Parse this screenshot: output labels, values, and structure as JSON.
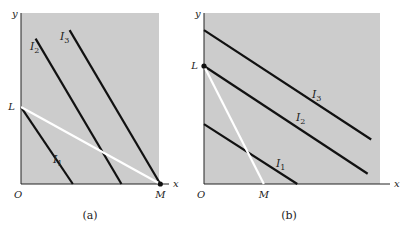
{
  "chart_data": [
    {
      "type": "line",
      "panel": "a",
      "caption": "(a)",
      "xlabel": "x",
      "ylabel": "y",
      "origin_label": "O",
      "xlim": [
        0,
        1
      ],
      "ylim": [
        0,
        1
      ],
      "points": [
        {
          "name": "L",
          "x": 0,
          "y": 0.45,
          "dot": false
        },
        {
          "name": "M",
          "x": 0.86,
          "y": 0,
          "dot": true
        }
      ],
      "budget_line": {
        "name": "LM",
        "color": "#ffffff",
        "from": [
          0,
          0.45
        ],
        "to": [
          0.86,
          0
        ]
      },
      "series": [
        {
          "name": "I1",
          "label_main": "I",
          "label_sub": "1",
          "color": "#111111",
          "from": [
            0,
            0.45
          ],
          "to": [
            0.32,
            0
          ]
        },
        {
          "name": "I2",
          "label_main": "I",
          "label_sub": "2",
          "color": "#111111",
          "from": [
            0.09,
            0.85
          ],
          "to": [
            0.62,
            0
          ]
        },
        {
          "name": "I3",
          "label_main": "I",
          "label_sub": "3",
          "color": "#111111",
          "from": [
            0.3,
            0.9
          ],
          "to": [
            0.86,
            0
          ]
        }
      ],
      "background": "#cccccc"
    },
    {
      "type": "line",
      "panel": "b",
      "caption": "(b)",
      "xlabel": "x",
      "ylabel": "y",
      "origin_label": "O",
      "xlim": [
        0,
        1
      ],
      "ylim": [
        0,
        1
      ],
      "points": [
        {
          "name": "L",
          "x": 0,
          "y": 0.69,
          "dot": true
        },
        {
          "name": "M",
          "x": 0.34,
          "y": 0,
          "dot": false
        }
      ],
      "budget_line": {
        "name": "LM",
        "color": "#ffffff",
        "from": [
          0,
          0.69
        ],
        "to": [
          0.34,
          0
        ]
      },
      "series": [
        {
          "name": "I1",
          "label_main": "I",
          "label_sub": "1",
          "color": "#111111",
          "from": [
            0,
            0.35
          ],
          "to": [
            0.53,
            0
          ]
        },
        {
          "name": "I2",
          "label_main": "I",
          "label_sub": "2",
          "color": "#111111",
          "from": [
            0,
            0.69
          ],
          "to": [
            0.93,
            0.06
          ]
        },
        {
          "name": "I3",
          "label_main": "I",
          "label_sub": "3",
          "color": "#111111",
          "from": [
            0,
            0.9
          ],
          "to": [
            0.95,
            0.26
          ]
        }
      ],
      "background": "#cccccc"
    }
  ]
}
